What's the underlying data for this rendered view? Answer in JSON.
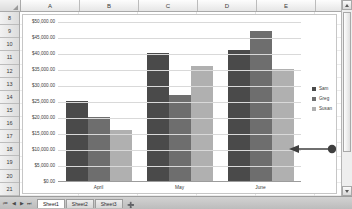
{
  "spreadsheet": {
    "columns": [
      "A",
      "B",
      "C",
      "D",
      "E"
    ],
    "rows": [
      "8",
      "9",
      "10",
      "11",
      "12",
      "13",
      "14",
      "15",
      "16",
      "17",
      "18",
      "19",
      "20",
      "21"
    ],
    "corner_name": "select-all",
    "tabs": [
      {
        "label": "Sheet1",
        "active": true
      },
      {
        "label": "Sheet2",
        "active": false
      },
      {
        "label": "Sheet3",
        "active": false
      }
    ],
    "tab_add_label": "➕",
    "nav": {
      "first": "⏮",
      "prev": "◀",
      "next": "▶",
      "last": "⏭"
    }
  },
  "scrollbar": {
    "up_arrow": "up-arrow",
    "down_arrow": "down-arrow",
    "thumb": "scroll-thumb"
  },
  "annotation": {
    "type": "arrow-pointer",
    "points_to": "Susan bar in June group",
    "color": "#3f3f3f"
  },
  "chart_data": {
    "type": "bar",
    "title": "",
    "xlabel": "",
    "ylabel": "",
    "categories": [
      "April",
      "May",
      "June"
    ],
    "series": [
      {
        "name": "Sam",
        "color": "#4a4a4a",
        "values": [
          25000,
          40000,
          41000
        ]
      },
      {
        "name": "Greg",
        "color": "#6e6e6e",
        "values": [
          20000,
          27000,
          47000
        ]
      },
      {
        "name": "Susan",
        "color": "#b0b0b0",
        "values": [
          16000,
          36000,
          35000
        ]
      }
    ],
    "ylim": [
      0,
      50000
    ],
    "ytick_labels": [
      "$50,000.00",
      "$45,000.00",
      "$40,000.00",
      "$35,000.00",
      "$30,000.00",
      "$25,000.00",
      "$20,000.00",
      "$15,000.00",
      "$10,000.00",
      "$5,000.00",
      "$0.00"
    ],
    "ytick_values": [
      50000,
      45000,
      40000,
      35000,
      30000,
      25000,
      20000,
      15000,
      10000,
      5000,
      0
    ],
    "grid": true,
    "legend_position": "right"
  }
}
